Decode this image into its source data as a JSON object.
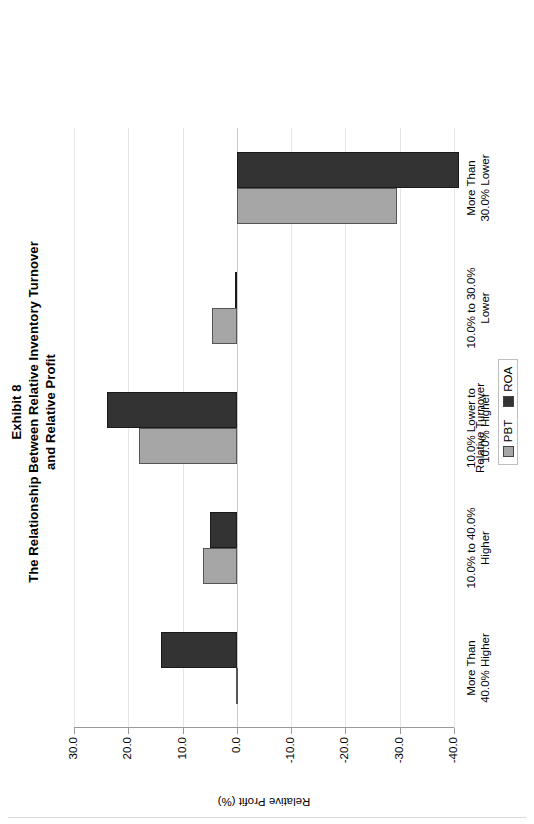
{
  "title": {
    "line1": "Exhibit 8",
    "line2": "The Relationship Between Relative Inventory Turnover",
    "line3": "and Relative Profit"
  },
  "legend": {
    "items": [
      {
        "label": "PBT",
        "color": "#a6a6a6"
      },
      {
        "label": "ROA",
        "color": "#333333"
      }
    ]
  },
  "axis": {
    "value_title": "Relative Profit (%)",
    "category_title": "Relative Turnover",
    "ticks": [
      "30.0",
      "20.0",
      "10.0",
      "0.0",
      "-10.0",
      "-20.0",
      "-30.0",
      "-40.0"
    ]
  },
  "categories": [
    {
      "line1": "More Than",
      "line2": "40.0% Higher"
    },
    {
      "line1": "10.0% to 40.0%",
      "line2": "Higher"
    },
    {
      "line1": "10.0% Lower to",
      "line2": "10.0% Higher"
    },
    {
      "line1": "10.0% to 30.0%",
      "line2": "Lower"
    },
    {
      "line1": "More Than",
      "line2": "30.0% Lower"
    }
  ],
  "chart_data": {
    "type": "bar",
    "orientation": "vertical",
    "xlabel": "Relative Turnover",
    "ylabel": "Relative Profit (%)",
    "ylim": [
      -40.0,
      30.0
    ],
    "ytick_values": [
      30.0,
      20.0,
      10.0,
      0.0,
      -10.0,
      -20.0,
      -30.0,
      -40.0
    ],
    "grid": false,
    "legend_position": "bottom",
    "categories": [
      "More Than 40.0% Higher",
      "10.0% to 40.0% Higher",
      "10.0% Lower to 10.0% Higher",
      "10.0% to 30.0% Lower",
      "More Than 30.0% Lower"
    ],
    "series": [
      {
        "name": "PBT",
        "color": "#a6a6a6",
        "values": [
          0.2,
          6.3,
          18.0,
          4.6,
          -29.5
        ]
      },
      {
        "name": "ROA",
        "color": "#333333",
        "values": [
          14.0,
          5.0,
          24.0,
          0.3,
          -41.0
        ]
      }
    ]
  }
}
